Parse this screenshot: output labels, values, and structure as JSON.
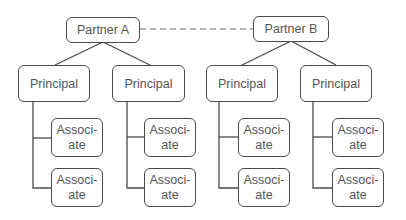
{
  "diagram": {
    "type": "org-chart",
    "colors": {
      "border": "#4a4a4a",
      "text": "#555555",
      "background": "#ffffff",
      "dashed_link": "#6a6a6a"
    },
    "partners": [
      {
        "label": "Partner A",
        "principals": [
          {
            "label": "Principal",
            "associates": [
              {
                "line1": "Associ-",
                "line2": "ate"
              },
              {
                "line1": "Associ-",
                "line2": "ate"
              }
            ]
          },
          {
            "label": "Principal",
            "associates": [
              {
                "line1": "Associ-",
                "line2": "ate"
              },
              {
                "line1": "Associ-",
                "line2": "ate"
              }
            ]
          }
        ]
      },
      {
        "label": "Partner B",
        "principals": [
          {
            "label": "Principal",
            "associates": [
              {
                "line1": "Associ-",
                "line2": "ate"
              },
              {
                "line1": "Associ-",
                "line2": "ate"
              }
            ]
          },
          {
            "label": "Principal",
            "associates": [
              {
                "line1": "Associ-",
                "line2": "ate"
              },
              {
                "line1": "Associ-",
                "line2": "ate"
              }
            ]
          }
        ]
      }
    ],
    "links": [
      {
        "from": "Partner A",
        "to": "Partner B",
        "style": "dashed"
      }
    ]
  }
}
